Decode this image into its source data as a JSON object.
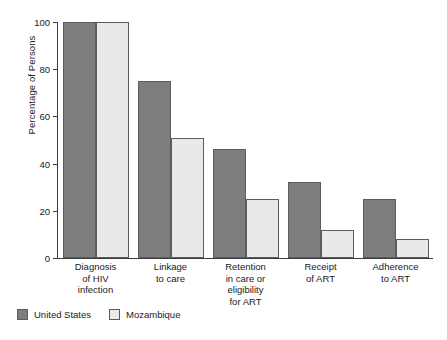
{
  "chart_data": {
    "type": "bar",
    "title": "",
    "subtitle": "",
    "xlabel": "",
    "ylabel": "Percentage of Persons",
    "ylim": [
      0,
      100
    ],
    "yticks": [
      0,
      20,
      40,
      60,
      80,
      100
    ],
    "ytick_labels": [
      "0",
      "20",
      "40",
      "60",
      "80",
      "100"
    ],
    "grid": false,
    "legend_position": "bottom-left",
    "categories": [
      "Diagnosis\nof HIV\ninfection",
      "Linkage\nto care",
      "Retention\nin care or\neligibility\nfor ART",
      "Receipt\nof ART",
      "Adherence\nto ART"
    ],
    "series": [
      {
        "name": "United States",
        "color": "#7d7d7d",
        "values": [
          100,
          75,
          46,
          32,
          25
        ]
      },
      {
        "name": "Mozambique",
        "color": "#e9e9e9",
        "values": [
          100,
          51,
          25,
          12,
          8
        ]
      }
    ]
  },
  "legend": {
    "items": [
      {
        "label": "United States",
        "swatch": "us"
      },
      {
        "label": "Mozambique",
        "swatch": "mz"
      }
    ]
  }
}
